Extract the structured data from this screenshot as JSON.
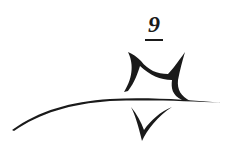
{
  "emblem": {
    "number": "9",
    "ink_color": "#1a1a1a",
    "background": "#ffffff"
  }
}
